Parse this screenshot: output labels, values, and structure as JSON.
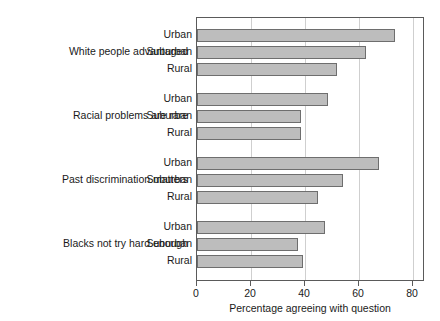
{
  "chart_data": {
    "type": "bar",
    "orientation": "horizontal",
    "title": "",
    "xlabel": "Percentage agreeing with question",
    "ylabel": "",
    "xlim": [
      0,
      84.4
    ],
    "xticks": [
      0,
      20,
      40,
      60,
      80
    ],
    "xtick_labels": [
      "0",
      "20",
      "40",
      "60",
      "80"
    ],
    "grid": "vertical",
    "legend": "none",
    "groups": [
      {
        "label": "White people advantaged",
        "categories": [
          "Urban",
          "Suburban",
          "Rural"
        ],
        "values": [
          73.3,
          62.5,
          51.8
        ]
      },
      {
        "label": "Racial problems are rare",
        "categories": [
          "Urban",
          "Suburban",
          "Rural"
        ],
        "values": [
          48.4,
          38.5,
          38.4
        ]
      },
      {
        "label": "Past discrimination matters",
        "categories": [
          "Urban",
          "Suburban",
          "Rural"
        ],
        "values": [
          67.3,
          54.2,
          44.7
        ]
      },
      {
        "label": "Blacks not try hard enough",
        "categories": [
          "Urban",
          "Suburban",
          "Rural"
        ],
        "values": [
          47.2,
          37.3,
          39.3
        ]
      }
    ],
    "colors": {
      "bar_fill": "#bdbdbd",
      "bar_edge": "#6e6e6e",
      "axis": "#5a5a5a",
      "gridline": "#cfcfcf",
      "text": "#1a1a1a",
      "background": "#ffffff"
    }
  }
}
